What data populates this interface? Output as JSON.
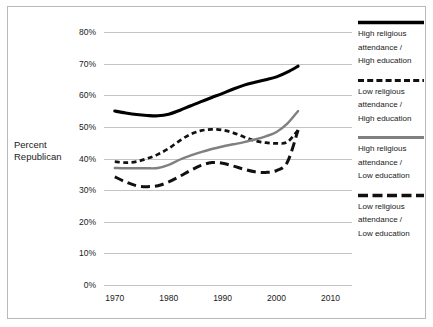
{
  "chart_data": {
    "type": "line",
    "title": "",
    "subtitle": "",
    "xlabel": "",
    "ylabel": "Percent Republican",
    "xlim": [
      1968,
      2014
    ],
    "ylim": [
      0,
      80
    ],
    "grid": true,
    "grid_axis": "y",
    "legend_position": "right",
    "y_tick_labels": [
      "80%",
      "70%",
      "60%",
      "50%",
      "40%",
      "30%",
      "20%",
      "10%",
      "0%"
    ],
    "y_tick_values": [
      80,
      70,
      60,
      50,
      40,
      30,
      20,
      10,
      0
    ],
    "x_tick_labels": [
      "1970",
      "1980",
      "1990",
      "2000",
      "2010"
    ],
    "x_tick_values": [
      1970,
      1980,
      1990,
      2000,
      2010
    ],
    "series": [
      {
        "name": "High religious attendance / High education",
        "style": "solid",
        "color": "#000000",
        "width": 3.1,
        "x": [
          1970,
          1972,
          1974,
          1976,
          1978,
          1980,
          1982,
          1984,
          1986,
          1988,
          1990,
          1992,
          1994,
          1996,
          1998,
          2000,
          2002,
          2004
        ],
        "values": [
          55.0,
          54.4,
          53.9,
          53.6,
          53.5,
          54.0,
          55.2,
          56.6,
          58.0,
          59.3,
          60.6,
          62.0,
          63.2,
          64.1,
          64.9,
          65.8,
          67.3,
          69.2
        ]
      },
      {
        "name": "Low religious attendance / High education",
        "style": "short-dash",
        "color": "#111111",
        "width": 2.7,
        "x": [
          1970,
          1972,
          1974,
          1976,
          1978,
          1980,
          1982,
          1984,
          1986,
          1988,
          1990,
          1992,
          1994,
          1996,
          1998,
          2000,
          2002,
          2004
        ],
        "values": [
          39.0,
          38.7,
          39.0,
          40.0,
          41.3,
          43.2,
          45.6,
          47.6,
          48.8,
          49.2,
          49.0,
          48.1,
          46.8,
          45.6,
          45.0,
          44.8,
          45.2,
          49.0
        ]
      },
      {
        "name": "High religious attendance / Low education",
        "style": "solid",
        "color": "#808080",
        "width": 2.4,
        "x": [
          1970,
          1972,
          1974,
          1976,
          1978,
          1980,
          1982,
          1984,
          1986,
          1988,
          1990,
          1992,
          1994,
          1996,
          1998,
          2000,
          2002,
          2004
        ],
        "values": [
          37.0,
          36.9,
          36.9,
          36.9,
          37.0,
          38.0,
          39.6,
          40.9,
          42.0,
          43.0,
          43.8,
          44.5,
          45.2,
          46.0,
          47.0,
          48.4,
          51.0,
          55.0
        ]
      },
      {
        "name": "Low religious attendance / Low education",
        "style": "long-dash",
        "color": "#111111",
        "width": 3.0,
        "x": [
          1970,
          1972,
          1974,
          1976,
          1978,
          1980,
          1982,
          1984,
          1986,
          1988,
          1990,
          1992,
          1994,
          1996,
          1998,
          2000,
          2002,
          2004
        ],
        "values": [
          34.2,
          32.6,
          31.4,
          31.1,
          31.4,
          32.6,
          34.3,
          36.2,
          37.8,
          38.7,
          38.5,
          37.6,
          36.6,
          35.8,
          35.6,
          36.2,
          38.8,
          49.0
        ]
      }
    ]
  },
  "axis": {
    "y_label_line1": "Percent",
    "y_label_line2": "Republican"
  },
  "y_ticks": [
    {
      "label": "80%",
      "value": 80
    },
    {
      "label": "70%",
      "value": 70
    },
    {
      "label": "60%",
      "value": 60
    },
    {
      "label": "50%",
      "value": 50
    },
    {
      "label": "40%",
      "value": 40
    },
    {
      "label": "30%",
      "value": 30
    },
    {
      "label": "20%",
      "value": 20
    },
    {
      "label": "10%",
      "value": 10
    },
    {
      "label": "0%",
      "value": 0
    }
  ],
  "x_ticks": [
    {
      "label": "1970",
      "value": 1970
    },
    {
      "label": "1980",
      "value": 1980
    },
    {
      "label": "1990",
      "value": 1990
    },
    {
      "label": "2000",
      "value": 2000
    },
    {
      "label": "2010",
      "value": 2010
    }
  ],
  "legend": {
    "entries": [
      {
        "swatch": "solid-black-line-icon",
        "line1": "High religious",
        "line2": "attendance /",
        "line3": "High education"
      },
      {
        "swatch": "short-dashed-black-line-icon",
        "line1": "Low religious",
        "line2": "attendance /",
        "line3": "High education"
      },
      {
        "swatch": "solid-gray-line-icon",
        "line1": "High religious",
        "line2": "attendance /",
        "line3": "Low education"
      },
      {
        "swatch": "long-dashed-black-line-icon",
        "line1": "Low religious",
        "line2": "attendance /",
        "line3": "Low education"
      }
    ]
  },
  "colors": {
    "series_black": "#000000",
    "series_gray": "#808080",
    "gridline": "#c4c4c4",
    "border": "#b9b9b9",
    "background": "#ffffff",
    "text": "#1a1a1a"
  }
}
